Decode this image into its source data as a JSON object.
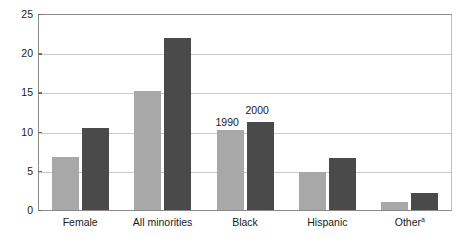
{
  "chart_data": {
    "type": "bar",
    "title": "",
    "subtitle": "",
    "xlabel": "",
    "ylabel": "",
    "ylim": [
      0,
      25
    ],
    "yticks": [
      0,
      5,
      10,
      15,
      20,
      25
    ],
    "ytick_labels": [
      "0",
      "5",
      "10",
      "15",
      "20",
      "25"
    ],
    "grid": true,
    "legend_position": "inline-annotation-above-black-group",
    "categories": [
      "Female",
      "All minorities",
      "Black",
      "Hispanic",
      "Other"
    ],
    "category_superscripts": [
      "",
      "",
      "",
      "",
      "a"
    ],
    "series": [
      {
        "name": "1990",
        "color": "#a8a8a8",
        "values": [
          6.8,
          15.2,
          10.2,
          4.8,
          1.0
        ]
      },
      {
        "name": "2000",
        "color": "#4a4a4a",
        "values": [
          10.4,
          22.0,
          11.2,
          6.6,
          2.2
        ]
      }
    ],
    "annotations": [
      {
        "text": "1990",
        "series": "1990",
        "category": "Black"
      },
      {
        "text": "2000",
        "series": "2000",
        "category": "Black"
      }
    ]
  },
  "axis": {
    "y_tick_labels": [
      "25",
      "20",
      "15",
      "10",
      "5",
      "0"
    ]
  },
  "colors": {
    "series_1990": "#a8a8a8",
    "series_2000": "#4a4a4a",
    "gridline": "#c9c9c9",
    "axis": "#8a8a8a",
    "background": "#ffffff",
    "text": "#1a1a1a"
  }
}
